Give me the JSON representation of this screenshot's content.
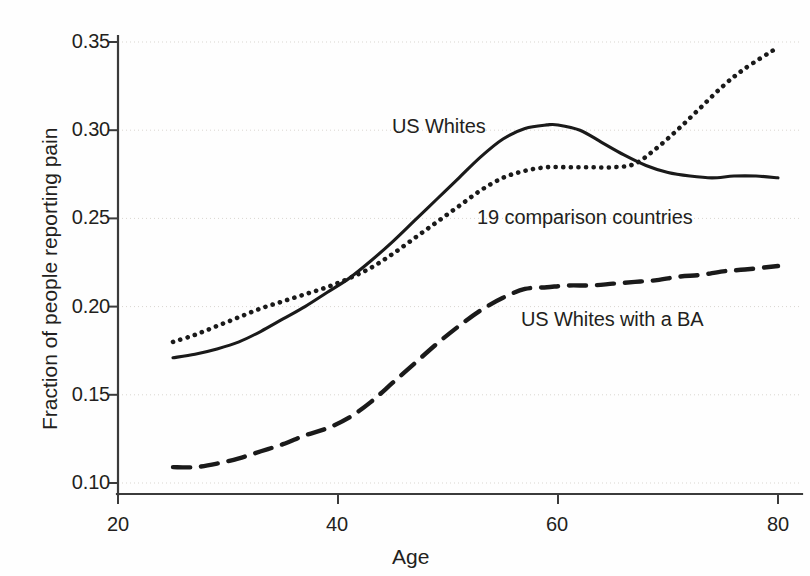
{
  "chart_data": {
    "type": "line",
    "title": "",
    "xlabel": "Age",
    "ylabel": "Fraction of people reporting pain",
    "xlim": [
      20,
      80
    ],
    "ylim": [
      0.1,
      0.35
    ],
    "xticks": [
      "20",
      "40",
      "60",
      "80"
    ],
    "xtick_values": [
      20,
      40,
      60,
      80
    ],
    "yticks": [
      "0.10",
      "0.15",
      "0.20",
      "0.25",
      "0.30",
      "0.35"
    ],
    "ytick_values": [
      0.1,
      0.15,
      0.2,
      0.25,
      0.3,
      0.35
    ],
    "grid": true,
    "legend_position": "inline-annotations",
    "line_color": "#1a1a1a",
    "series": [
      {
        "name": "US Whites",
        "style": "solid",
        "label_text": "US Whites",
        "x": [
          25,
          27,
          29,
          31,
          33,
          35,
          37,
          39,
          41,
          43,
          45,
          47,
          49,
          51,
          53,
          55,
          57,
          59,
          60,
          62,
          64,
          66,
          68,
          70,
          72,
          74,
          76,
          78,
          80
        ],
        "values": [
          0.171,
          0.173,
          0.176,
          0.18,
          0.186,
          0.193,
          0.2,
          0.208,
          0.216,
          0.226,
          0.237,
          0.249,
          0.261,
          0.273,
          0.285,
          0.295,
          0.301,
          0.303,
          0.303,
          0.3,
          0.293,
          0.286,
          0.28,
          0.276,
          0.274,
          0.273,
          0.274,
          0.274,
          0.273
        ]
      },
      {
        "name": "19 comparison countries",
        "style": "dotted",
        "label_text": "19 comparison countries",
        "x": [
          25,
          27,
          29,
          31,
          33,
          35,
          37,
          39,
          41,
          43,
          45,
          47,
          49,
          51,
          53,
          55,
          57,
          59,
          61,
          63,
          65,
          67,
          69,
          71,
          73,
          75,
          77,
          80
        ],
        "values": [
          0.18,
          0.184,
          0.189,
          0.194,
          0.199,
          0.203,
          0.207,
          0.211,
          0.216,
          0.222,
          0.23,
          0.239,
          0.248,
          0.257,
          0.266,
          0.273,
          0.277,
          0.279,
          0.279,
          0.279,
          0.279,
          0.281,
          0.29,
          0.301,
          0.313,
          0.325,
          0.335,
          0.347
        ]
      },
      {
        "name": "US Whites with a BA",
        "style": "dashed",
        "label_text": "US Whites with a BA",
        "x": [
          25,
          27,
          29,
          31,
          33,
          35,
          37,
          39,
          41,
          43,
          45,
          47,
          49,
          51,
          53,
          55,
          57,
          59,
          61,
          63,
          65,
          67,
          69,
          71,
          73,
          75,
          77,
          80
        ],
        "values": [
          0.109,
          0.109,
          0.111,
          0.114,
          0.118,
          0.122,
          0.127,
          0.131,
          0.137,
          0.146,
          0.157,
          0.168,
          0.179,
          0.189,
          0.198,
          0.205,
          0.21,
          0.211,
          0.212,
          0.212,
          0.213,
          0.214,
          0.215,
          0.217,
          0.218,
          0.22,
          0.221,
          0.223
        ]
      }
    ]
  }
}
